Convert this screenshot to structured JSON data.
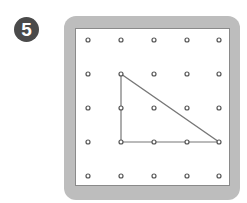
{
  "problem_number": "5",
  "geoboard": {
    "rows": 5,
    "cols": 5,
    "peg_x": [
      88,
      121,
      154,
      187,
      219
    ],
    "peg_y": [
      40,
      74,
      108,
      142,
      176
    ],
    "frame_color": "#bdbdbd",
    "peg_color": "#555555",
    "band_color": "#777777"
  },
  "shape": {
    "type": "right-triangle",
    "vertices": [
      [
        1,
        1
      ],
      [
        1,
        3
      ],
      [
        4,
        3
      ]
    ]
  }
}
